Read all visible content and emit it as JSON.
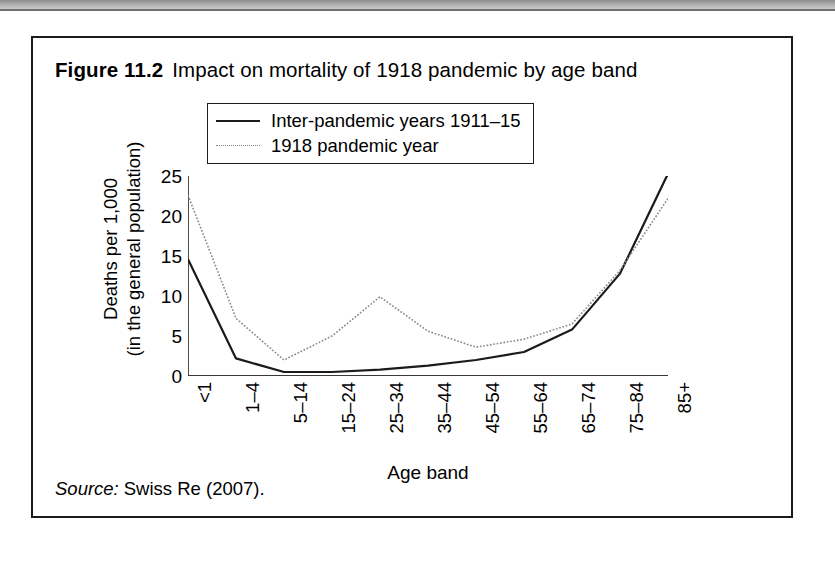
{
  "figure": {
    "number": "Figure 11.2",
    "caption": "Impact on mortality of 1918 pandemic by age band",
    "source_word": "Source:",
    "source_text": "Swiss Re (2007)."
  },
  "chart_data": {
    "type": "line",
    "title": "Impact on mortality of 1918 pandemic by age band",
    "xlabel": "Age band",
    "ylabel": "Deaths per 1,000 (in the general population)",
    "ylabel_line1": "Deaths per 1,000",
    "ylabel_line2": "(in the general population)",
    "categories": [
      "<1",
      "1–4",
      "5–14",
      "15–24",
      "25–34",
      "35–44",
      "45–54",
      "55–64",
      "65–74",
      "75–84",
      "85+"
    ],
    "series": [
      {
        "name": "Inter-pandemic years 1911–15",
        "style": "solid",
        "color": "#1b1b1b",
        "values": [
          14.6,
          2.2,
          0.5,
          0.5,
          0.8,
          1.3,
          2.0,
          3.0,
          5.8,
          12.8,
          25.3
        ]
      },
      {
        "name": "1918 pandemic year",
        "style": "dotted",
        "color": "#8a8a8a",
        "values": [
          22.6,
          7.2,
          2.0,
          5.0,
          9.9,
          5.6,
          3.6,
          4.6,
          6.5,
          13.2,
          22.2
        ]
      }
    ],
    "ylim": [
      0,
      25
    ],
    "yticks": [
      0,
      5,
      10,
      15,
      20,
      25
    ],
    "ytick_labels": [
      "0",
      "5",
      "10",
      "15",
      "20",
      "25"
    ],
    "grid": false,
    "legend_position": "top-center",
    "legend": [
      "Inter-pandemic years 1911–15",
      "1918 pandemic year"
    ]
  }
}
